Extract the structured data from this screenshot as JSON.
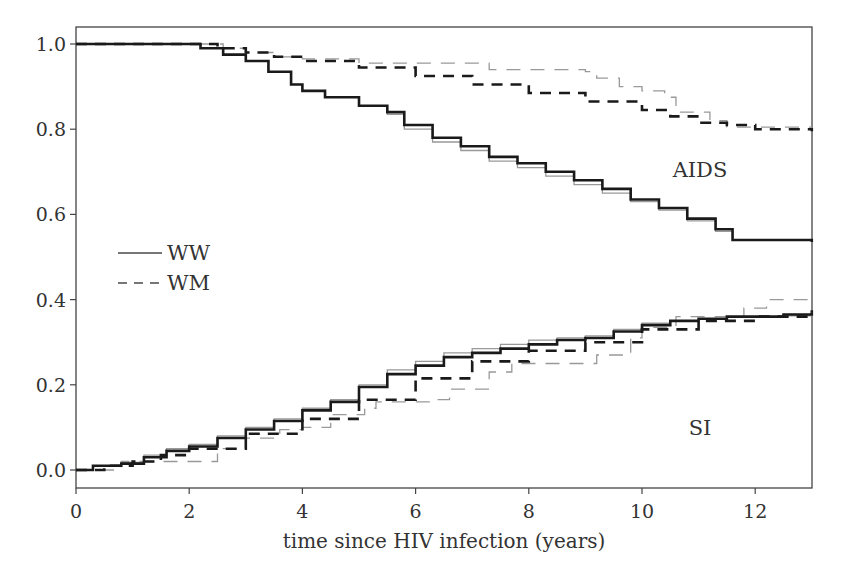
{
  "chart_data": {
    "type": "line",
    "title": "",
    "xlabel": "time since HIV infection (years)",
    "ylabel": "",
    "xlim": [
      0,
      13
    ],
    "ylim": [
      -0.04,
      1.04
    ],
    "x_ticks": [
      0,
      2,
      4,
      6,
      8,
      10,
      12
    ],
    "x_tick_labels": [
      "0",
      "2",
      "4",
      "6",
      "8",
      "10",
      "12"
    ],
    "y_ticks": [
      0.0,
      0.2,
      0.4,
      0.6,
      0.8,
      1.0
    ],
    "y_tick_labels": [
      "0.0",
      "0.2",
      "0.4",
      "0.6",
      "0.8",
      "1.0"
    ],
    "grid": false,
    "legend": {
      "position": "left-middle",
      "entries": [
        {
          "label": "WW",
          "style": "solid"
        },
        {
          "label": "WM",
          "style": "dashed"
        }
      ]
    },
    "annotations": [
      {
        "text": "AIDS",
        "x": 11.2,
        "y": 0.66
      },
      {
        "text": "SI",
        "x": 11.2,
        "y": 0.16
      }
    ],
    "series": [
      {
        "name": "AIDS-free WW (fitted)",
        "group": "AIDS",
        "legend": "WW",
        "style": "solid-thick",
        "color": "#1a1a1a",
        "x": [
          0,
          1.5,
          2.2,
          2.6,
          3.0,
          3.4,
          3.8,
          4.0,
          4.4,
          5.0,
          5.5,
          5.8,
          6.3,
          6.8,
          7.3,
          7.8,
          8.3,
          8.8,
          9.3,
          9.8,
          10.3,
          10.8,
          11.3,
          11.6,
          12.0,
          13.0
        ],
        "y": [
          1.0,
          1.0,
          0.99,
          0.975,
          0.96,
          0.935,
          0.905,
          0.89,
          0.875,
          0.855,
          0.84,
          0.81,
          0.78,
          0.76,
          0.735,
          0.72,
          0.7,
          0.68,
          0.66,
          0.635,
          0.615,
          0.59,
          0.565,
          0.54,
          0.54,
          0.535
        ]
      },
      {
        "name": "AIDS-free WW (empirical)",
        "group": "AIDS",
        "legend": "WW",
        "style": "solid-thin-gray",
        "color": "#999999",
        "x": [
          0,
          1.5,
          2.2,
          2.6,
          3.0,
          3.4,
          3.8,
          4.0,
          4.4,
          5.0,
          5.5,
          5.8,
          6.3,
          6.8,
          7.3,
          7.8,
          8.3,
          8.8,
          9.3,
          9.8,
          10.3,
          10.8,
          11.3,
          11.6,
          12.0,
          13.0
        ],
        "y": [
          1.0,
          1.0,
          0.99,
          0.975,
          0.96,
          0.935,
          0.905,
          0.89,
          0.875,
          0.855,
          0.835,
          0.8,
          0.77,
          0.75,
          0.725,
          0.71,
          0.69,
          0.67,
          0.65,
          0.63,
          0.61,
          0.585,
          0.56,
          0.54,
          0.54,
          0.535
        ]
      },
      {
        "name": "AIDS-free WM (fitted)",
        "group": "AIDS",
        "legend": "WM",
        "style": "dashed-thick",
        "color": "#1a1a1a",
        "x": [
          0,
          2.0,
          2.5,
          3.0,
          3.5,
          4.0,
          5.0,
          6.0,
          7.0,
          8.0,
          9.0,
          10.0,
          10.5,
          11.0,
          11.5,
          12.0,
          13.0
        ],
        "y": [
          1.0,
          1.0,
          0.99,
          0.98,
          0.97,
          0.96,
          0.945,
          0.925,
          0.905,
          0.885,
          0.865,
          0.845,
          0.83,
          0.815,
          0.81,
          0.8,
          0.795
        ]
      },
      {
        "name": "AIDS-free WM (empirical)",
        "group": "AIDS",
        "legend": "WM",
        "style": "dashed-thin-gray",
        "color": "#999999",
        "x": [
          0,
          2.0,
          2.6,
          3.0,
          3.5,
          4.0,
          4.3,
          5.0,
          6.0,
          7.3,
          8.2,
          9.0,
          9.2,
          9.6,
          10.0,
          10.4,
          10.6,
          11.2,
          11.5,
          13.0
        ],
        "y": [
          1.0,
          1.0,
          0.99,
          0.98,
          0.97,
          0.965,
          0.965,
          0.955,
          0.955,
          0.94,
          0.94,
          0.935,
          0.92,
          0.9,
          0.89,
          0.875,
          0.84,
          0.82,
          0.805,
          0.805
        ]
      },
      {
        "name": "SI WW (fitted)",
        "group": "SI",
        "legend": "WW",
        "style": "solid-thick",
        "color": "#1a1a1a",
        "x": [
          0,
          0.3,
          0.8,
          1.2,
          1.6,
          2.0,
          2.5,
          3.0,
          3.5,
          4.0,
          4.5,
          5.0,
          5.5,
          6.0,
          6.5,
          7.0,
          7.5,
          8.0,
          8.5,
          9.0,
          9.5,
          10.0,
          10.5,
          11.0,
          11.5,
          12.0,
          12.5,
          13.0
        ],
        "y": [
          0.0,
          0.01,
          0.015,
          0.03,
          0.045,
          0.055,
          0.075,
          0.095,
          0.115,
          0.14,
          0.16,
          0.195,
          0.225,
          0.245,
          0.265,
          0.275,
          0.285,
          0.295,
          0.305,
          0.31,
          0.325,
          0.34,
          0.35,
          0.355,
          0.36,
          0.36,
          0.365,
          0.37
        ]
      },
      {
        "name": "SI WW (empirical)",
        "group": "SI",
        "legend": "WW",
        "style": "solid-thin-gray",
        "color": "#999999",
        "x": [
          0,
          0.3,
          0.8,
          1.2,
          1.6,
          2.0,
          2.5,
          3.0,
          3.5,
          4.0,
          4.5,
          5.0,
          5.5,
          6.0,
          6.5,
          7.0,
          7.5,
          8.0,
          8.5,
          9.0,
          9.5,
          10.0,
          10.5,
          11.0,
          11.5,
          12.0,
          12.5,
          13.0
        ],
        "y": [
          0.0,
          0.01,
          0.018,
          0.035,
          0.05,
          0.06,
          0.08,
          0.1,
          0.12,
          0.145,
          0.165,
          0.2,
          0.235,
          0.255,
          0.275,
          0.285,
          0.295,
          0.305,
          0.31,
          0.315,
          0.33,
          0.345,
          0.35,
          0.355,
          0.36,
          0.36,
          0.362,
          0.365
        ]
      },
      {
        "name": "SI WM (fitted)",
        "group": "SI",
        "legend": "WM",
        "style": "dashed-thick",
        "color": "#1a1a1a",
        "x": [
          0,
          0.5,
          1.0,
          1.5,
          2.0,
          3.0,
          4.0,
          5.0,
          6.0,
          7.0,
          8.0,
          9.0,
          10.0,
          11.0,
          12.0,
          13.0
        ],
        "y": [
          0.0,
          0.01,
          0.02,
          0.035,
          0.05,
          0.085,
          0.12,
          0.165,
          0.215,
          0.255,
          0.28,
          0.3,
          0.33,
          0.35,
          0.36,
          0.375
        ]
      },
      {
        "name": "SI WM (empirical)",
        "group": "SI",
        "legend": "WM",
        "style": "dashed-thin-gray",
        "color": "#999999",
        "x": [
          0,
          0.8,
          2.5,
          3.0,
          3.6,
          4.0,
          4.5,
          5.1,
          5.3,
          6.4,
          6.6,
          7.3,
          7.7,
          8.9,
          9.2,
          9.8,
          10.0,
          10.6,
          11.3,
          11.8,
          12.2,
          13.0
        ],
        "y": [
          0.0,
          0.02,
          0.05,
          0.075,
          0.095,
          0.1,
          0.13,
          0.145,
          0.16,
          0.165,
          0.19,
          0.23,
          0.25,
          0.25,
          0.27,
          0.31,
          0.335,
          0.36,
          0.36,
          0.38,
          0.4,
          0.4
        ]
      }
    ]
  }
}
